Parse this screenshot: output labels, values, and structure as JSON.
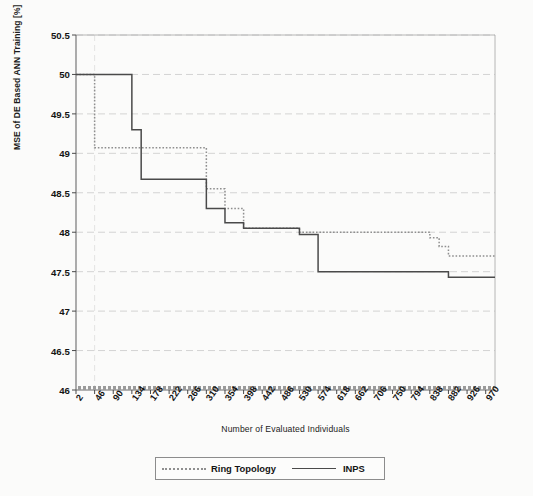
{
  "chart_data": {
    "type": "line",
    "title": "",
    "subtitle": "",
    "xlabel": "Number of Evaluated Individuals",
    "ylabel": "MSE of DE Based ANN Training [%]",
    "xlim": [
      2,
      992
    ],
    "ylim": [
      46,
      50.5
    ],
    "grid": true,
    "legend_position": "bottom-center",
    "xtick_labels": [
      "2",
      "46",
      "90",
      "134",
      "178",
      "222",
      "266",
      "310",
      "354",
      "398",
      "442",
      "486",
      "530",
      "574",
      "618",
      "662",
      "706",
      "750",
      "794",
      "838",
      "882",
      "926",
      "970"
    ],
    "xtick_values": [
      2,
      46,
      90,
      134,
      178,
      222,
      266,
      310,
      354,
      398,
      442,
      486,
      530,
      574,
      618,
      662,
      706,
      750,
      794,
      838,
      882,
      926,
      970
    ],
    "ytick_labels": [
      "46",
      "46.5",
      "47",
      "47.5",
      "48",
      "48.5",
      "49",
      "49.5",
      "50",
      "50.5"
    ],
    "ytick_values": [
      46,
      46.5,
      47,
      47.5,
      48,
      48.5,
      49,
      49.5,
      50,
      50.5
    ],
    "step_style": "post",
    "series": [
      {
        "name": "Ring Topology",
        "style": "dotted",
        "color": "#8f8f8f",
        "x": [
          2,
          24,
          46,
          266,
          310,
          354,
          398,
          486,
          530,
          816,
          838,
          860,
          882,
          970,
          992
        ],
        "values": [
          50.0,
          50.0,
          49.07,
          49.07,
          48.55,
          48.3,
          48.05,
          48.05,
          48.0,
          48.0,
          47.93,
          47.82,
          47.7,
          47.7,
          47.7
        ]
      },
      {
        "name": "INPS",
        "style": "solid",
        "color": "#4a4a4a",
        "x": [
          2,
          112,
          134,
          156,
          266,
          310,
          354,
          398,
          442,
          530,
          574,
          882,
          970,
          992
        ],
        "values": [
          50.0,
          50.0,
          49.3,
          48.67,
          48.67,
          48.3,
          48.12,
          48.05,
          48.05,
          47.97,
          47.5,
          47.43,
          47.43,
          47.43
        ]
      }
    ],
    "baseline_marker": {
      "name": "bottom-axis-emphasis",
      "y": 46.0,
      "color": "#9a9a9a"
    }
  },
  "legend": {
    "entries": [
      {
        "label": "Ring Topology",
        "style": "dotted"
      },
      {
        "label": "INPS",
        "style": "solid"
      }
    ]
  },
  "axes": {
    "x_title": "Number of Evaluated Individuals",
    "y_title": "MSE of DE Based ANN Training [%]"
  }
}
